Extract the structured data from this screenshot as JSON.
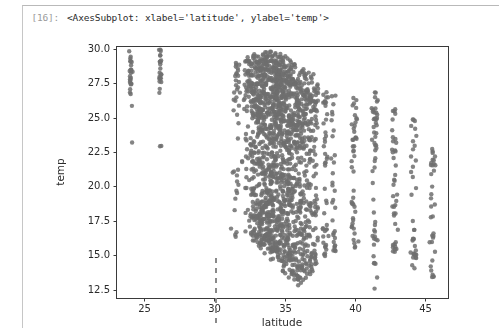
{
  "cell": {
    "prompt_label": "[16]:",
    "output_text": "<AxesSubplot: xlabel='latitude', ylabel='temp'>"
  },
  "colors": {
    "point": "#6f6f6f",
    "axis": "#3a3a3a",
    "tick_text": "#2b2b2b",
    "cell_border": "#b9b9b9",
    "prompt": "#9a9a9a",
    "caret": "#8a8a8a",
    "background": "#ffffff"
  },
  "caret": {
    "x": 215,
    "y_top": 258,
    "y_bottom": 328
  },
  "chart_data": {
    "type": "scatter",
    "title": "",
    "xlabel": "latitude",
    "ylabel": "temp",
    "xlim": [
      23.0,
      46.6
    ],
    "ylim": [
      11.9,
      30.2
    ],
    "xticks": [
      25,
      30,
      35,
      40,
      45
    ],
    "xticklabels": [
      "25",
      "30",
      "35",
      "40",
      "45"
    ],
    "yticks": [
      12.5,
      15.0,
      17.5,
      20.0,
      22.5,
      25.0,
      27.5,
      30.0
    ],
    "yticklabels": [
      "12.5",
      "15.0",
      "17.5",
      "20.0",
      "22.5",
      "25.0",
      "27.5",
      "30.0"
    ],
    "grid": false,
    "legend": null,
    "marker": {
      "size": 3.0,
      "color": "#6f6f6f",
      "alpha": 0.85
    },
    "point_count_approx": 2100,
    "bands": [
      {
        "lat": 24.05,
        "n": 26,
        "t_low": 22.8,
        "t_high": 29.6,
        "t_mode": 28.3,
        "spread": "bimodal"
      },
      {
        "lat": 26.15,
        "n": 24,
        "t_low": 22.8,
        "t_high": 29.7,
        "t_mode": 28.5,
        "spread": "bimodal"
      },
      {
        "lat": 31.6,
        "n": 40,
        "t_low": 16.3,
        "t_high": 29.3,
        "t_mode": 25.0,
        "spread": "wide"
      },
      {
        "lat": 32.3,
        "n": 48,
        "t_low": 16.6,
        "t_high": 29.6,
        "t_mode": 25.3,
        "spread": "wide"
      },
      {
        "lat": 32.8,
        "n": 120,
        "t_low": 16.0,
        "t_high": 29.6,
        "t_mode": 24.5,
        "spread": "dense"
      },
      {
        "lat": 33.2,
        "n": 150,
        "t_low": 15.6,
        "t_high": 29.4,
        "t_mode": 24.0,
        "spread": "dense"
      },
      {
        "lat": 33.6,
        "n": 170,
        "t_low": 15.2,
        "t_high": 29.5,
        "t_mode": 23.6,
        "spread": "dense"
      },
      {
        "lat": 34.0,
        "n": 180,
        "t_low": 14.8,
        "t_high": 29.6,
        "t_mode": 23.2,
        "spread": "dense"
      },
      {
        "lat": 34.4,
        "n": 175,
        "t_low": 14.5,
        "t_high": 29.5,
        "t_mode": 22.8,
        "spread": "dense"
      },
      {
        "lat": 34.8,
        "n": 165,
        "t_low": 14.1,
        "t_high": 29.3,
        "t_mode": 22.4,
        "spread": "dense"
      },
      {
        "lat": 35.2,
        "n": 150,
        "t_low": 13.7,
        "t_high": 29.2,
        "t_mode": 22.0,
        "spread": "dense"
      },
      {
        "lat": 35.6,
        "n": 135,
        "t_low": 13.4,
        "t_high": 29.0,
        "t_mode": 21.6,
        "spread": "dense"
      },
      {
        "lat": 36.0,
        "n": 120,
        "t_low": 13.0,
        "t_high": 28.8,
        "t_mode": 21.2,
        "spread": "dense"
      },
      {
        "lat": 36.4,
        "n": 100,
        "t_low": 13.2,
        "t_high": 28.4,
        "t_mode": 20.8,
        "spread": "dense"
      },
      {
        "lat": 36.8,
        "n": 80,
        "t_low": 13.6,
        "t_high": 28.0,
        "t_mode": 20.4,
        "spread": "medium"
      },
      {
        "lat": 37.2,
        "n": 58,
        "t_low": 14.2,
        "t_high": 27.4,
        "t_mode": 20.0,
        "spread": "medium"
      },
      {
        "lat": 37.9,
        "n": 44,
        "t_low": 14.4,
        "t_high": 26.9,
        "t_mode": 20.4,
        "spread": "medium"
      },
      {
        "lat": 38.5,
        "n": 30,
        "t_low": 14.9,
        "t_high": 26.6,
        "t_mode": 20.6,
        "spread": "medium"
      },
      {
        "lat": 39.9,
        "n": 46,
        "t_low": 15.4,
        "t_high": 26.6,
        "t_mode": 20.5,
        "spread": "medium"
      },
      {
        "lat": 41.4,
        "n": 52,
        "t_low": 12.6,
        "t_high": 27.0,
        "t_mode": 19.7,
        "spread": "medium"
      },
      {
        "lat": 42.8,
        "n": 40,
        "t_low": 14.7,
        "t_high": 25.9,
        "t_mode": 19.6,
        "spread": "medium"
      },
      {
        "lat": 44.2,
        "n": 36,
        "t_low": 14.2,
        "t_high": 24.8,
        "t_mode": 19.0,
        "spread": "medium"
      },
      {
        "lat": 45.5,
        "n": 34,
        "t_low": 13.2,
        "t_high": 23.0,
        "t_mode": 18.2,
        "spread": "medium"
      }
    ]
  }
}
